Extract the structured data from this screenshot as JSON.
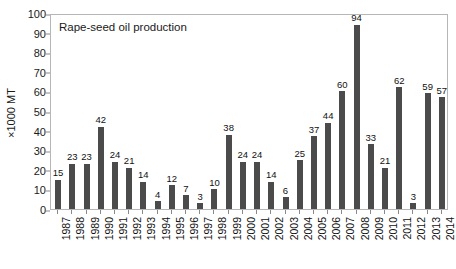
{
  "chart_data": {
    "type": "bar",
    "title": "Rape-seed oil production",
    "xlabel": "",
    "ylabel": "×1000 MT",
    "ylim": [
      0,
      100
    ],
    "ytick_step": 10,
    "yticks": [
      0,
      10,
      20,
      30,
      40,
      50,
      60,
      70,
      80,
      90,
      100
    ],
    "grid": false,
    "legend": null,
    "bar_color": "#4b4b4b",
    "frame_color": "#b6b6b6",
    "show_value_labels": true,
    "categories": [
      "1987",
      "1988",
      "1989",
      "1990",
      "1991",
      "1992",
      "1993",
      "1994",
      "1995",
      "1996",
      "1997",
      "1998",
      "1999",
      "2000",
      "2001",
      "2002",
      "2003",
      "2004",
      "2005",
      "2006",
      "2007",
      "2008",
      "2009",
      "2010",
      "2011",
      "2012",
      "2013",
      "2014"
    ],
    "values": [
      15,
      23,
      23,
      42,
      24,
      21,
      14,
      4,
      12,
      7,
      3,
      10,
      38,
      24,
      24,
      14,
      6,
      25,
      37,
      44,
      60,
      94,
      33,
      21,
      62,
      3,
      59,
      57
    ]
  }
}
